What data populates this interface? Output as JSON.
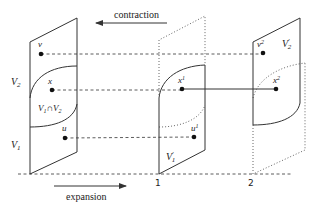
{
  "diagram": {
    "arrows": {
      "contraction": {
        "label": "contraction",
        "direction": "left"
      },
      "expansion": {
        "label": "expansion",
        "direction": "right"
      }
    },
    "axis_ticks": [
      "1",
      "2"
    ],
    "panels": {
      "left": {
        "labels": {
          "V2": "V",
          "V2_sub": "2",
          "V1": "V",
          "V1_sub": "1",
          "intersection": "V",
          "intersection_sub1": "1",
          "intersection_op": "∩V",
          "intersection_sub2": "2"
        }
      },
      "middle": {
        "label": "V",
        "label_sup": "′",
        "label_sub": "1"
      },
      "right": {
        "label": "V",
        "label_sup": "′",
        "label_sub": "2"
      }
    },
    "points": {
      "v": {
        "label": "v"
      },
      "x": {
        "label": "x"
      },
      "u": {
        "label": "u"
      },
      "x1": {
        "label": "x",
        "sup": "1"
      },
      "u1": {
        "label": "u",
        "sup": "1"
      },
      "v2": {
        "label": "v",
        "sup": "2"
      },
      "x2": {
        "label": "x",
        "sup": "2"
      }
    },
    "colors": {
      "line": "#333333",
      "point": "#111111",
      "background": "#ffffff"
    }
  }
}
